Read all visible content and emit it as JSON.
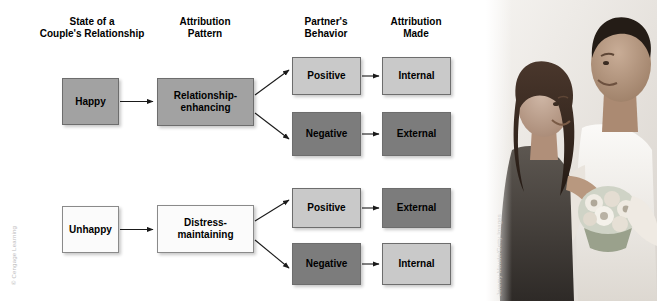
{
  "figure": {
    "columns": [
      {
        "id": "state",
        "label": "State of a\nCouple's Relationship"
      },
      {
        "id": "pattern",
        "label": "Attribution\nPattern"
      },
      {
        "id": "behavior",
        "label": "Partner's\nBehavior"
      },
      {
        "id": "attribution",
        "label": "Attribution\nMade"
      }
    ],
    "rows": [
      {
        "id": "happy-row",
        "state": "Happy",
        "pattern": "Relationship-\nenhancing",
        "branches": [
          {
            "behavior": "Positive",
            "attribution": "Internal"
          },
          {
            "behavior": "Negative",
            "attribution": "External"
          }
        ]
      },
      {
        "id": "unhappy-row",
        "state": "Unhappy",
        "pattern": "Distress-\nmaintaining",
        "branches": [
          {
            "behavior": "Positive",
            "attribution": "External"
          },
          {
            "behavior": "Negative",
            "attribution": "Internal"
          }
        ]
      }
    ],
    "credits": {
      "publisher": "© Cengage Learning",
      "photo": "Jeremy Maude/Getty Images"
    },
    "colors": {
      "mid_gray": "#a2a2a2",
      "dark_gray": "#7c7c7c",
      "light_gray": "#c9c9c9",
      "white_box": "#fbfbfb",
      "border": "#6d6d6d",
      "text": "#000000",
      "background": "#ffffff"
    }
  }
}
